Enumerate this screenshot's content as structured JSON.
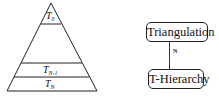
{
  "pyramid": {
    "levels": [
      {
        "base": "T",
        "sub": "0"
      },
      {
        "base": "T",
        "sub": "N-1"
      },
      {
        "base": "T",
        "sub": "N"
      }
    ],
    "stroke_color": "#222222"
  },
  "relation": {
    "top_box": "Triangulation",
    "bottom_box": "T-Hierarchy",
    "cardinality": "N"
  }
}
